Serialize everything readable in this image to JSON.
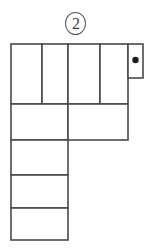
{
  "figure": {
    "label_number": "2",
    "label_style": "circled",
    "caption": "",
    "kind": "grid-polyomino-net",
    "colors": {
      "stroke": "#4a4a4a",
      "fill": "#ffffff",
      "dot": "#1a1a1a",
      "label": "#3b3b3b",
      "background": "#ffffff"
    },
    "grid": {
      "unit_width": 29,
      "unit_height": 30,
      "origin_x": 11,
      "origin_y": 44,
      "columns": 4,
      "rows": 5
    },
    "cells": [
      {
        "name": "row1-col1",
        "x": 11,
        "y": 44,
        "w": 31,
        "h": 60
      },
      {
        "name": "row1-col2",
        "x": 42,
        "y": 44,
        "w": 26,
        "h": 60
      },
      {
        "name": "row1-col3",
        "x": 68,
        "y": 44,
        "w": 32,
        "h": 60
      },
      {
        "name": "row1-col4",
        "x": 100,
        "y": 44,
        "w": 28,
        "h": 60
      },
      {
        "name": "row2-col1",
        "x": 11,
        "y": 104,
        "w": 57,
        "h": 36
      },
      {
        "name": "row2-col2",
        "x": 68,
        "y": 104,
        "w": 60,
        "h": 36
      },
      {
        "name": "row3-col1",
        "x": 11,
        "y": 140,
        "w": 57,
        "h": 35
      },
      {
        "name": "row4-col1",
        "x": 11,
        "y": 175,
        "w": 57,
        "h": 33
      },
      {
        "name": "row5-col1",
        "x": 11,
        "y": 208,
        "w": 57,
        "h": 32
      }
    ],
    "tab": {
      "name": "dot-tab",
      "x": 128,
      "y": 44,
      "w": 15,
      "h": 34,
      "has_dot": true,
      "dot": {
        "cx": 135.5,
        "cy": 60,
        "r": 3.2
      }
    },
    "outline": {
      "left": 11,
      "top": 44,
      "right": 128,
      "bottom": 240
    }
  }
}
